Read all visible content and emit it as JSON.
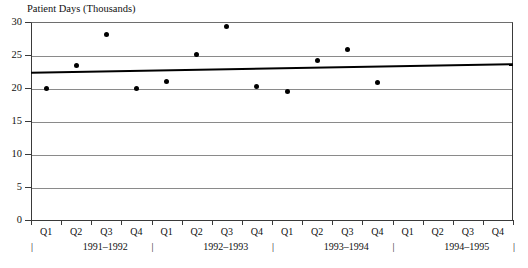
{
  "chart_data": {
    "type": "scatter",
    "title": "Patient Days (Thousands)",
    "xlabel": "",
    "ylabel": "Patient Days (Thousands)",
    "ylim": [
      0,
      30
    ],
    "yticks": [
      0,
      5,
      10,
      15,
      20,
      25,
      30
    ],
    "ytick_labels": [
      "0",
      "5",
      "10",
      "15",
      "20",
      "25",
      "30"
    ],
    "grid": true,
    "legend": "none",
    "categories": [
      "Q1",
      "Q2",
      "Q3",
      "Q4",
      "Q1",
      "Q2",
      "Q3",
      "Q4",
      "Q1",
      "Q2",
      "Q3",
      "Q4",
      "Q1",
      "Q2",
      "Q3",
      "Q4"
    ],
    "group_labels": [
      "1991–1992",
      "1992–1993",
      "1993–1994",
      "1994–1995"
    ],
    "values": [
      20.0,
      23.4,
      28.1,
      20.0,
      21.0,
      25.1,
      29.3,
      20.2,
      19.4,
      24.2,
      25.9,
      20.9,
      null,
      null,
      null,
      null
    ],
    "points": [
      {
        "index": 0,
        "quarter": "Q1",
        "period": "1991–1992",
        "value": 20.0
      },
      {
        "index": 1,
        "quarter": "Q2",
        "period": "1991–1992",
        "value": 23.4
      },
      {
        "index": 2,
        "quarter": "Q3",
        "period": "1991–1992",
        "value": 28.1
      },
      {
        "index": 3,
        "quarter": "Q4",
        "period": "1991–1992",
        "value": 20.0
      },
      {
        "index": 4,
        "quarter": "Q1",
        "period": "1992–1993",
        "value": 21.0
      },
      {
        "index": 5,
        "quarter": "Q2",
        "period": "1992–1993",
        "value": 25.1
      },
      {
        "index": 6,
        "quarter": "Q3",
        "period": "1992–1993",
        "value": 29.3
      },
      {
        "index": 7,
        "quarter": "Q4",
        "period": "1992–1993",
        "value": 20.2
      },
      {
        "index": 8,
        "quarter": "Q1",
        "period": "1993–1994",
        "value": 19.4
      },
      {
        "index": 9,
        "quarter": "Q2",
        "period": "1993–1994",
        "value": 24.2
      },
      {
        "index": 10,
        "quarter": "Q3",
        "period": "1993–1994",
        "value": 25.9
      },
      {
        "index": 11,
        "quarter": "Q4",
        "period": "1993–1994",
        "value": 20.9
      }
    ],
    "trendline": {
      "type": "linear",
      "start_value": 22.3,
      "end_value": 23.6,
      "start_index": 0,
      "end_index": 15
    },
    "colors": {
      "point": "#000000",
      "trendline": "#000000",
      "grid": "#8a8a8a",
      "axis": "#3a3a3a",
      "background": "#ffffff"
    }
  },
  "year_tick_marker": "|"
}
